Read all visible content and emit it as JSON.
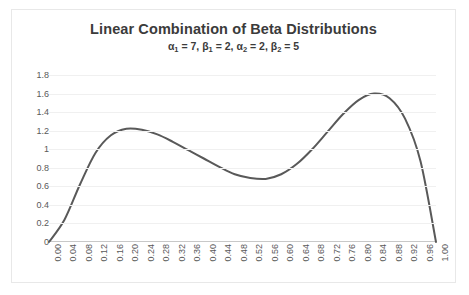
{
  "chart_data": {
    "type": "line",
    "title": "Linear Combination of Beta Distributions",
    "subtitle_parts": {
      "a1_label": "α",
      "a1_sub": "1",
      "a1_value": "7",
      "b1_label": "β",
      "b1_sub": "1",
      "b1_value": "2",
      "a2_label": "α",
      "a2_sub": "2",
      "a2_value": "2",
      "b2_label": "β",
      "b2_sub": "2",
      "b2_value": "5"
    },
    "subtitle_text": "α1 = 7, β1 = 2, α2 = 2, β2 = 5",
    "parameters": {
      "alpha_1": 7,
      "beta_1": 2,
      "alpha_2": 2,
      "beta_2": 5
    },
    "xlabel": "",
    "ylabel": "",
    "xlim": [
      0.0,
      1.0
    ],
    "ylim": [
      0,
      1.8
    ],
    "grid": "horizontal",
    "legend": "none",
    "line_color": "#595959",
    "line_width": 2,
    "y_ticks": [
      "0",
      "0.2",
      "0.4",
      "0.6",
      "0.8",
      "1",
      "1.2",
      "1.4",
      "1.6",
      "1.8"
    ],
    "y_tick_values": [
      0,
      0.2,
      0.4,
      0.6,
      0.8,
      1.0,
      1.2,
      1.4,
      1.6,
      1.8
    ],
    "x_ticks": [
      "0.00",
      "0.04",
      "0.08",
      "0.12",
      "0.16",
      "0.20",
      "0.24",
      "0.28",
      "0.32",
      "0.36",
      "0.40",
      "0.44",
      "0.48",
      "0.52",
      "0.56",
      "0.60",
      "0.64",
      "0.68",
      "0.72",
      "0.76",
      "0.80",
      "0.84",
      "0.88",
      "0.92",
      "0.96",
      "1.00"
    ],
    "x": [
      0.0,
      0.04,
      0.08,
      0.12,
      0.16,
      0.2,
      0.24,
      0.28,
      0.32,
      0.36,
      0.4,
      0.44,
      0.48,
      0.52,
      0.56,
      0.6,
      0.64,
      0.68,
      0.72,
      0.76,
      0.8,
      0.84,
      0.88,
      0.92,
      0.96,
      1.0
    ],
    "values": [
      0.0,
      0.24,
      0.62,
      0.96,
      1.15,
      1.22,
      1.21,
      1.16,
      1.08,
      0.99,
      0.9,
      0.81,
      0.73,
      0.69,
      0.68,
      0.73,
      0.84,
      1.0,
      1.19,
      1.38,
      1.53,
      1.6,
      1.55,
      1.33,
      0.87,
      0.0
    ],
    "annotations": {
      "peak_1": {
        "x": 0.2,
        "y": 1.22
      },
      "local_min": {
        "x": 0.55,
        "y": 0.68
      },
      "peak_2": {
        "x": 0.84,
        "y": 1.6
      }
    }
  }
}
